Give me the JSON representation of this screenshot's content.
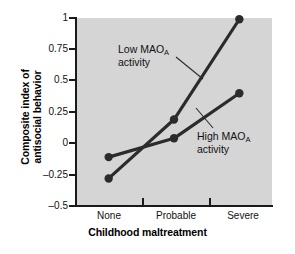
{
  "chart_data": {
    "type": "line",
    "title": "",
    "xlabel": "Childhood maltreatment",
    "ylabel_line1": "Composite index of",
    "ylabel_line2": "antisocial behavior",
    "categories": [
      "None",
      "Probable",
      "Severe"
    ],
    "ytick_labels": [
      "1",
      "0.75",
      "0.5",
      "0.25",
      "0",
      "–0.25",
      "–0.5"
    ],
    "ytick_values": [
      1,
      0.75,
      0.5,
      0.25,
      0,
      -0.25,
      -0.5
    ],
    "ylim": [
      -0.5,
      1
    ],
    "grid": false,
    "legend": "annotations",
    "plot_background": "#d5d5d5",
    "series": [
      {
        "name": "Low MAOₐ activity",
        "label_line1": "Low MAO",
        "label_sub": "A",
        "label_line1_tail": "",
        "label_line2": "activity",
        "color": "#2b2b2b",
        "values": [
          -0.28,
          0.19,
          0.99
        ]
      },
      {
        "name": "High MAOₐ activity",
        "label_line1": "High MAO",
        "label_sub": "A",
        "label_line1_tail": "",
        "label_line2": "activity",
        "color": "#2b2b2b",
        "values": [
          -0.11,
          0.04,
          0.4
        ]
      }
    ],
    "annotations": [
      {
        "text": "Low MAO",
        "sub": "A",
        "text2": "activity",
        "points_to": "low-mao-line"
      },
      {
        "text": "High MAO",
        "sub": "A",
        "text2": "activity",
        "points_to": "high-mao-line"
      }
    ]
  }
}
